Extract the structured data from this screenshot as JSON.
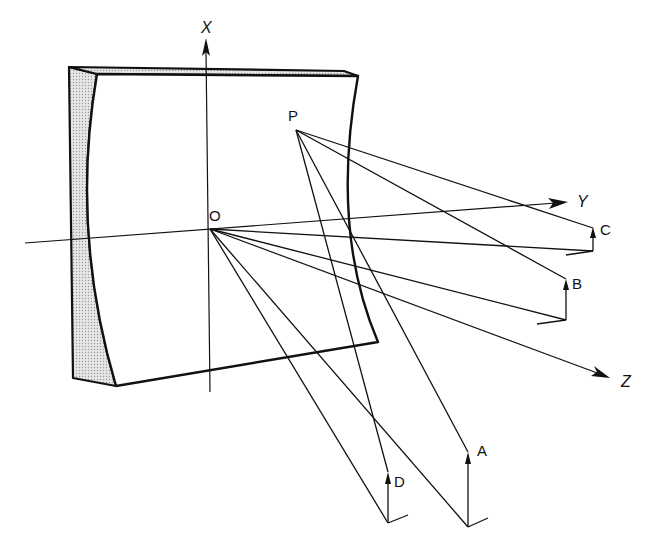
{
  "diagram": {
    "colors": {
      "ink": "#111111",
      "shading": "#d8d8d8",
      "background": "#ffffff"
    },
    "axes": {
      "x": {
        "label": "X"
      },
      "y": {
        "label": "Y"
      },
      "z": {
        "label": "Z"
      }
    },
    "points": {
      "origin": {
        "label": "O"
      },
      "source": {
        "label": "P"
      },
      "image_a": {
        "label": "A"
      },
      "image_b": {
        "label": "B"
      },
      "image_c": {
        "label": "C"
      },
      "image_d": {
        "label": "D"
      }
    }
  }
}
